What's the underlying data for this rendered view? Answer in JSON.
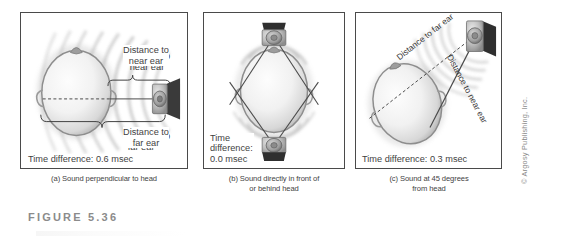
{
  "figure": {
    "label_prefix": "FIGURE",
    "label_number": "5.36",
    "credit": "© Argosy Publishing, Inc."
  },
  "panels": [
    {
      "id": "a",
      "caption": "(a) Sound perpendicular to head",
      "time_difference_label": "Time difference: 0.6 msec",
      "time_difference_value": "0.6 msec",
      "annotations": [
        {
          "name": "distance-to-near-ear",
          "text": "Distance to\nnear ear"
        },
        {
          "name": "distance-to-far-ear",
          "text": "Distance to\nfar ear"
        }
      ],
      "speaker_count": 1,
      "speaker_position": "right"
    },
    {
      "id": "b",
      "caption": "(b) Sound directly in front of\nor behind head",
      "time_difference_label": "Time\ndifference:\n0.0 msec",
      "time_difference_value": "0.0 msec",
      "annotations": [],
      "speaker_count": 2,
      "speaker_position": "top-and-bottom"
    },
    {
      "id": "c",
      "caption": "(c) Sound at 45 degrees\nfrom head",
      "time_difference_label": "Time difference: 0.3 msec",
      "time_difference_value": "0.3 msec",
      "annotations": [
        {
          "name": "distance-to-far-ear",
          "text": "Distance to far ear"
        },
        {
          "name": "distance-to-near-ear",
          "text": "Distance to near ear"
        }
      ],
      "speaker_count": 1,
      "speaker_position": "top-right"
    }
  ],
  "colors": {
    "panel_border": "#4a4a4a",
    "text": "#3f3f3f",
    "figure_label": "#8b8b8b",
    "credit": "#8a8a8a",
    "head_outline": "#8d8d8d",
    "sound_wave": "#9a9a9a",
    "background": "#ffffff"
  }
}
